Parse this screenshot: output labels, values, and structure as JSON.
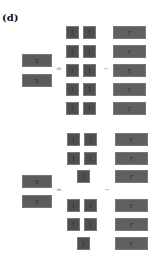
{
  "panel_label": "(d)",
  "colors": {
    "small_box": "#4f4f4f",
    "wide_box": "#606060",
    "left_box": "#5c5c5c",
    "glyph": "#333333",
    "operator": "#999999"
  },
  "top_equation": {
    "equals": "=",
    "minus": "−",
    "left": [
      {
        "glyph": "x"
      },
      {
        "glyph": "x"
      }
    ],
    "middle": [
      [
        "1",
        "1"
      ],
      [
        "1",
        "1"
      ],
      [
        "1",
        "1"
      ],
      [
        "1",
        "1"
      ],
      [
        "1",
        "1"
      ]
    ],
    "right": [
      {
        "glyph": "r"
      },
      {
        "glyph": "r"
      },
      {
        "glyph": "r"
      },
      {
        "glyph": "r"
      },
      {
        "glyph": "r"
      }
    ]
  },
  "bottom_equation": {
    "equals": "=",
    "minus": "−",
    "left": [
      {
        "glyph": "x"
      },
      {
        "glyph": "x"
      }
    ],
    "middle": [
      [
        "1",
        "1"
      ],
      [
        "1",
        "1"
      ],
      [
        "1"
      ],
      [
        "1",
        "1"
      ],
      [
        "1",
        "1"
      ],
      [
        "1"
      ]
    ],
    "right": [
      {
        "glyph": "r"
      },
      {
        "glyph": "r"
      },
      {
        "glyph": "r"
      },
      {
        "glyph": "r"
      },
      {
        "glyph": "r"
      },
      {
        "glyph": "r"
      }
    ]
  }
}
